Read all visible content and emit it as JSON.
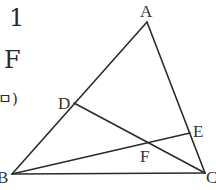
{
  "fragments": {
    "number": "1",
    "letter": "F",
    "paren": "ㅁ)"
  },
  "diagram": {
    "type": "triangle-with-cevians",
    "line_color": "#2b2b2b",
    "points": {
      "A": {
        "label": "A",
        "x": 147,
        "y": 22
      },
      "B": {
        "label": "B",
        "x": 12,
        "y": 174
      },
      "C": {
        "label": "C",
        "x": 205,
        "y": 173
      },
      "D": {
        "label": "D",
        "x": 74,
        "y": 103
      },
      "E": {
        "label": "E",
        "x": 190,
        "y": 133
      },
      "F": {
        "label": "F",
        "x": 148,
        "y": 143
      }
    },
    "segments": [
      [
        "A",
        "B"
      ],
      [
        "A",
        "C"
      ],
      [
        "B",
        "C"
      ],
      [
        "D",
        "C"
      ],
      [
        "B",
        "E"
      ]
    ]
  }
}
